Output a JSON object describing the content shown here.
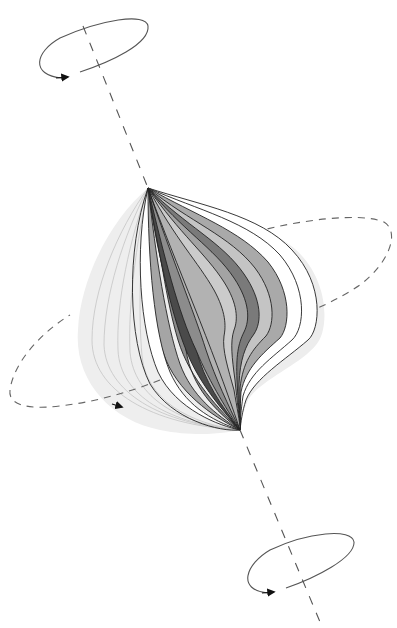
{
  "figure": {
    "caption": "",
    "colors": {
      "background": "#ffffff",
      "stroke": "#222222",
      "dash": "#666666",
      "ghost_fill": "#ececec",
      "ghost_line": "#b8b8b8",
      "layer_white": "#ffffff",
      "layer_light": "#c8c8c8",
      "layer_mid": "#a9a9a9",
      "layer_dark": "#7d7d7d",
      "layer_darkest": "#4a4a4a",
      "core": "#b6b6b6"
    }
  },
  "elements": {
    "top_rotation_ellipse": {
      "label": "",
      "direction": "counterclockwise-arrow"
    },
    "bottom_rotation_ellipse": {
      "label": "",
      "direction": "counterclockwise-arrow"
    },
    "equatorial_dashed_ellipse": {
      "label": "",
      "direction": "arrow-right"
    },
    "rotation_axis": {
      "label": "",
      "style": "dashed"
    },
    "bulb": {
      "label": "",
      "layers": 14
    },
    "ghost_lobe": {
      "label": "",
      "lines": 6
    }
  }
}
